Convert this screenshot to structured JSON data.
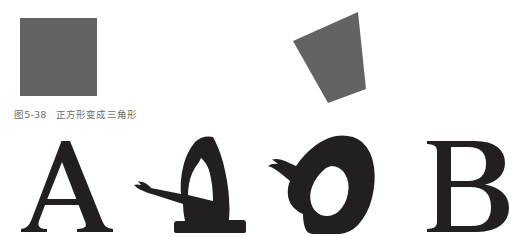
{
  "figure": {
    "caption_number": "图5-38",
    "caption_text": "正方形变成三角形",
    "shape_fill": "#636363",
    "letter_fill": "#231f1f",
    "background": "#ffffff",
    "caption_color": "#6d6d6d"
  },
  "shape_sequence": {
    "label": "正方形变成三角形",
    "steps": [
      {
        "name": "square",
        "label": "正方形",
        "fill": "#636363",
        "points": "20,18 97,18 97,96 20,96"
      },
      {
        "name": "tilted-quadrilateral",
        "label": "倾斜四边形",
        "fill": "#636363",
        "points": "225,12 233,89 195,103 160,41"
      },
      {
        "name": "near-triangle",
        "label": "近似三角形",
        "fill": "#636363",
        "points": "355,16 363,101 336,101 299,72"
      },
      {
        "name": "triangle",
        "label": "三角形",
        "fill": "#636363",
        "points": "478,15 518,97 437,97"
      }
    ]
  },
  "letter_sequence": {
    "label": "A 变成 B",
    "steps": [
      {
        "name": "letter-a",
        "label": "A",
        "fill": "#231f1f"
      },
      {
        "name": "letter-a-warped",
        "label": "A 变形",
        "fill": "#231f1f"
      },
      {
        "name": "letter-b-warped",
        "label": "B 变形",
        "fill": "#231f1f"
      },
      {
        "name": "letter-b",
        "label": "B",
        "fill": "#231f1f"
      }
    ]
  }
}
